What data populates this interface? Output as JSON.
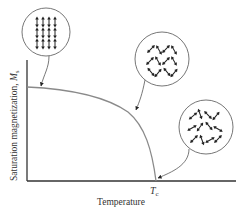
{
  "diagram": {
    "type": "magnetization-vs-temperature",
    "y_axis_label": "Saturation magnetization, ",
    "y_axis_symbol": "M",
    "y_axis_subscript": "s",
    "x_axis_label": "Temperature",
    "critical_point_symbol": "T",
    "critical_point_subscript": "c",
    "insets": [
      {
        "name": "aligned-dipoles",
        "description": "All dipoles aligned vertically (low temperature)"
      },
      {
        "name": "partially-aligned-dipoles",
        "description": "Dipoles partially aligned (intermediate temperature)"
      },
      {
        "name": "random-dipoles",
        "description": "Dipoles randomly oriented (at Curie temperature)"
      }
    ],
    "colors": {
      "axis": "#333333",
      "curve": "#8a8a8a",
      "circle": "#666666",
      "arrow": "#222222"
    }
  }
}
